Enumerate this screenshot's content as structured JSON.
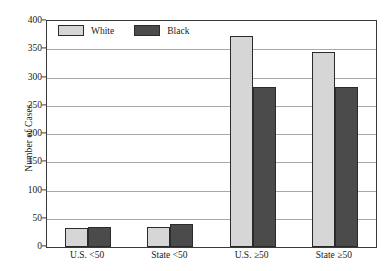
{
  "chart_data": {
    "type": "bar",
    "title": "",
    "xlabel": "",
    "ylabel": "Number of Cases",
    "categories": [
      "U.S. <50",
      "State <50",
      "U.S. ≥50",
      "State ≥50"
    ],
    "series": [
      {
        "name": "White",
        "color": "#d6d6d6",
        "values": [
          34,
          36,
          373,
          345
        ]
      },
      {
        "name": "Black",
        "color": "#4b4b4b",
        "values": [
          35,
          40,
          283,
          284
        ]
      }
    ],
    "ylim": [
      0,
      400
    ],
    "ytick_labels": [
      "0",
      "50",
      "100",
      "150",
      "200",
      "250",
      "300",
      "350",
      "400"
    ],
    "ytick_values": [
      0,
      50,
      100,
      150,
      200,
      250,
      300,
      350,
      400
    ],
    "grid": true,
    "legend_position": "top-left"
  },
  "legend": {
    "entries": [
      {
        "label": "White",
        "swatch": "light-gray-swatch"
      },
      {
        "label": "Black",
        "swatch": "dark-gray-swatch"
      }
    ]
  },
  "axes": {
    "y_title": "Number of Cases"
  }
}
